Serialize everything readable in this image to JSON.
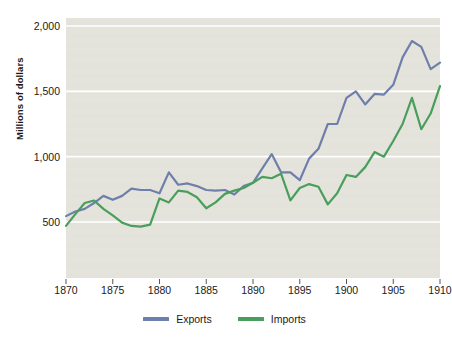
{
  "chart_data": {
    "type": "line",
    "title": "",
    "xlabel": "",
    "ylabel": "Millions of dollars",
    "xlim": [
      1870,
      1910
    ],
    "ylim": [
      0,
      2100
    ],
    "grid": true,
    "legend_position": "bottom-center",
    "y_ticks": [
      "500",
      "1,000",
      "1,500",
      "2,000"
    ],
    "y_tick_values": [
      500,
      1000,
      1500,
      2000
    ],
    "x_ticks": [
      "1870",
      "1875",
      "1880",
      "1885",
      "1890",
      "1895",
      "1900",
      "1905",
      "1910"
    ],
    "x_tick_values": [
      1870,
      1875,
      1880,
      1885,
      1890,
      1895,
      1900,
      1905,
      1910
    ],
    "x": [
      1870,
      1871,
      1872,
      1873,
      1874,
      1875,
      1876,
      1877,
      1878,
      1879,
      1880,
      1881,
      1882,
      1883,
      1884,
      1885,
      1886,
      1887,
      1888,
      1889,
      1890,
      1891,
      1892,
      1893,
      1894,
      1895,
      1896,
      1897,
      1898,
      1899,
      1900,
      1901,
      1902,
      1903,
      1904,
      1905,
      1906,
      1907,
      1908,
      1909,
      1910
    ],
    "series": [
      {
        "name": "Exports",
        "color": "#6f7fac",
        "values": [
          545,
          580,
          600,
          645,
          700,
          670,
          700,
          755,
          745,
          745,
          720,
          880,
          785,
          795,
          775,
          745,
          740,
          745,
          710,
          775,
          800,
          910,
          1020,
          880,
          880,
          820,
          985,
          1060,
          1250,
          1250,
          1450,
          1500,
          1400,
          1480,
          1475,
          1550,
          1760,
          1885,
          1840,
          1670,
          1720
        ]
      },
      {
        "name": "Imports",
        "color": "#4a9e5c",
        "values": [
          470,
          560,
          645,
          665,
          600,
          550,
          495,
          470,
          465,
          480,
          680,
          650,
          740,
          730,
          690,
          605,
          650,
          715,
          740,
          760,
          800,
          845,
          835,
          870,
          665,
          760,
          790,
          770,
          635,
          720,
          860,
          845,
          920,
          1035,
          1000,
          1120,
          1250,
          1450,
          1210,
          1330,
          1540
        ]
      }
    ]
  },
  "legend": {
    "items": [
      {
        "label": "Exports",
        "color": "#6f7fac"
      },
      {
        "label": "Imports",
        "color": "#4a9e5c"
      }
    ]
  },
  "plot": {
    "background_color": "#e3e3db",
    "gridline_color": "#ffffff"
  }
}
